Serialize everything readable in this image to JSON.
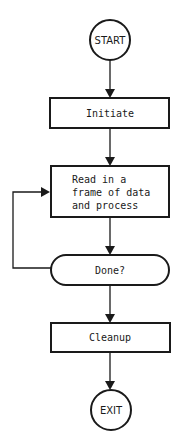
{
  "diagram": {
    "type": "flowchart",
    "nodes": [
      {
        "id": "start",
        "shape": "circle",
        "label": "START"
      },
      {
        "id": "initiate",
        "shape": "rectangle",
        "label": "Initiate"
      },
      {
        "id": "process",
        "shape": "rectangle",
        "lines": [
          "Read in a",
          "frame of data",
          "and process"
        ]
      },
      {
        "id": "done",
        "shape": "rounded-rectangle",
        "label": "Done?"
      },
      {
        "id": "cleanup",
        "shape": "rectangle",
        "label": "Cleanup"
      },
      {
        "id": "exit",
        "shape": "circle",
        "label": "EXIT"
      }
    ],
    "edges": [
      {
        "from": "start",
        "to": "initiate"
      },
      {
        "from": "initiate",
        "to": "process"
      },
      {
        "from": "process",
        "to": "done"
      },
      {
        "from": "done",
        "to": "process",
        "note": "loop back"
      },
      {
        "from": "done",
        "to": "cleanup"
      },
      {
        "from": "cleanup",
        "to": "exit"
      }
    ]
  },
  "labels": {
    "start": "START",
    "initiate": "Initiate",
    "process_line1": "Read in a",
    "process_line2": "frame of data",
    "process_line3": "and process",
    "done": "Done?",
    "cleanup": "Cleanup",
    "exit": "EXIT"
  }
}
